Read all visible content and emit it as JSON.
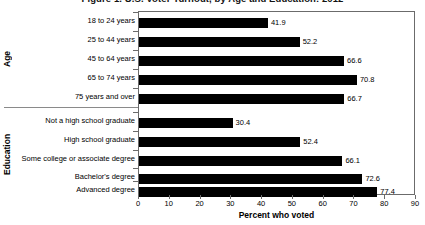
{
  "chart_data": {
    "type": "bar",
    "orientation": "horizontal",
    "title": "Figure 1. U.S. Voter Turnout, by Age and Education: 2012",
    "xlabel": "Percent who voted",
    "ylabel": "",
    "xlim": [
      0,
      90
    ],
    "xticks": [
      0,
      10,
      20,
      30,
      40,
      50,
      60,
      70,
      80,
      90
    ],
    "grid": false,
    "legend": "none",
    "bar_color": "#000000",
    "groups": [
      {
        "name": "Age",
        "categories": [
          "18 to 24 years",
          "25 to 44 years",
          "45 to 64 years",
          "65 to 74 years",
          "75 years and over"
        ],
        "values": [
          41.9,
          52.2,
          66.6,
          70.8,
          66.7
        ]
      },
      {
        "name": "Education",
        "categories": [
          "Not a high school graduate",
          "High school graduate",
          "Some college or associate degree",
          "Bachelor's degree",
          "Advanced degree"
        ],
        "values": [
          30.4,
          52.4,
          66.1,
          72.6,
          77.4
        ]
      }
    ],
    "categories": [
      "18 to 24 years",
      "25 to 44 years",
      "45 to 64 years",
      "65 to 74 years",
      "75 years and over",
      "Not a high school graduate",
      "High school graduate",
      "Some college or associate degree",
      "Bachelor's degree",
      "Advanced degree"
    ],
    "values": [
      41.9,
      52.2,
      66.6,
      70.8,
      66.7,
      30.4,
      52.4,
      66.1,
      72.6,
      77.4
    ],
    "value_labels": [
      "41.9",
      "52.2",
      "66.6",
      "70.8",
      "66.7",
      "30.4",
      "52.4",
      "66.1",
      "72.6",
      "77.4"
    ],
    "xtick_labels": [
      "0",
      "10",
      "20",
      "30",
      "40",
      "50",
      "60",
      "70",
      "80",
      "90"
    ]
  }
}
